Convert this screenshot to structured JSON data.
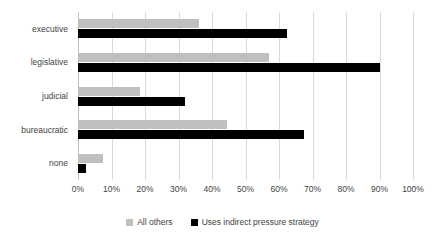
{
  "chart_data": {
    "type": "bar",
    "orientation": "horizontal",
    "title": "",
    "subtitle": "",
    "xlabel": "",
    "ylabel": "",
    "xlim": [
      0,
      100
    ],
    "xtick_labels": [
      "0%",
      "10%",
      "20%",
      "30%",
      "40%",
      "50%",
      "60%",
      "70%",
      "80%",
      "90%",
      "100%"
    ],
    "xtick_values": [
      0,
      10,
      20,
      30,
      40,
      50,
      60,
      70,
      80,
      90,
      100
    ],
    "grid": "vertical",
    "legend_position": "bottom",
    "categories": [
      "executive",
      "legislative",
      "judicial",
      "bureaucratic",
      "none"
    ],
    "series": [
      {
        "name": "All others",
        "color": "#bfbfbf",
        "values": [
          36,
          57,
          18.5,
          44.5,
          7.5
        ]
      },
      {
        "name": "Uses indirect pressure strategy",
        "color": "#000000",
        "values": [
          62.5,
          90,
          32,
          67.5,
          2.5
        ]
      }
    ]
  },
  "legend": {
    "items": [
      {
        "label": "All others"
      },
      {
        "label": "Uses indirect pressure strategy"
      }
    ]
  },
  "colors": {
    "series_others": "#bfbfbf",
    "series_indirect": "#000000",
    "gridline": "#d9d9d9",
    "axis": "#bfbfbf",
    "text": "#3f3f3f",
    "background": "#ffffff"
  }
}
